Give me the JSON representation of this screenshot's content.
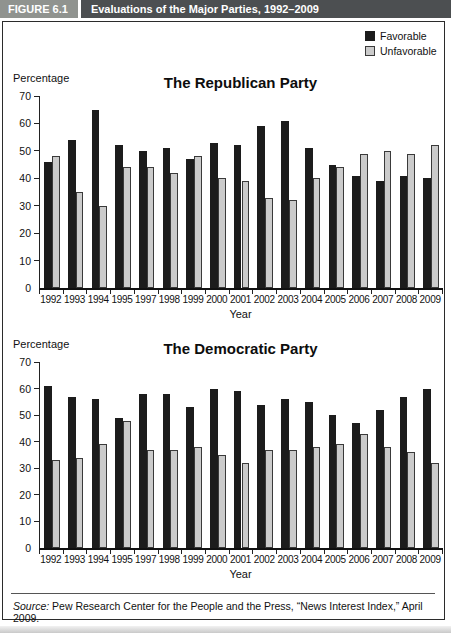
{
  "header": {
    "figure_label": "FIGURE 6.1",
    "title": "Evaluations of the Major Parties, 1992–2009"
  },
  "legend": {
    "position": "top-right",
    "items": [
      {
        "label": "Favorable",
        "color": "#1c1c1c",
        "swatch": "black-square-icon"
      },
      {
        "label": "Unfavorable",
        "color": "#cbcbcb",
        "swatch": "gray-square-icon"
      }
    ]
  },
  "source": {
    "prefix": "Source:",
    "text": " Pew Research Center for the People and the Press, “News Interest Index,” April 2009."
  },
  "colors": {
    "header_label_bg": "#90938f",
    "header_title_bg": "#4c4f51",
    "favorable_bar": "#1c1c1c",
    "unfavorable_bar": "#cbcbcb",
    "border": "#2b2b2b"
  },
  "chart_data": [
    {
      "type": "bar",
      "title": "The Republican Party",
      "ylabel": "Percentage",
      "xlabel": "Year",
      "ylim": [
        0,
        70
      ],
      "yticks": [
        0,
        10,
        20,
        30,
        40,
        50,
        60,
        70
      ],
      "grid": false,
      "legend_position": "top-right",
      "categories": [
        "1992",
        "1993",
        "1994",
        "1995",
        "1997",
        "1998",
        "1999",
        "2000",
        "2001",
        "2002",
        "2003",
        "2004",
        "2005",
        "2006",
        "2007",
        "2008",
        "2009"
      ],
      "series": [
        {
          "name": "Favorable",
          "color": "#1c1c1c",
          "values": [
            46,
            54,
            65,
            52,
            50,
            51,
            47,
            53,
            52,
            59,
            61,
            51,
            45,
            41,
            39,
            41,
            40
          ]
        },
        {
          "name": "Unfavorable",
          "color": "#cbcbcb",
          "values": [
            48,
            35,
            30,
            44,
            44,
            42,
            48,
            40,
            39,
            33,
            32,
            40,
            44,
            49,
            50,
            49,
            52
          ]
        }
      ]
    },
    {
      "type": "bar",
      "title": "The Democratic Party",
      "ylabel": "Percentage",
      "xlabel": "Year",
      "ylim": [
        0,
        70
      ],
      "yticks": [
        0,
        10,
        20,
        30,
        40,
        50,
        60,
        70
      ],
      "grid": false,
      "legend_position": "none",
      "categories": [
        "1992",
        "1993",
        "1994",
        "1995",
        "1997",
        "1998",
        "1999",
        "2000",
        "2001",
        "2002",
        "2003",
        "2004",
        "2005",
        "2006",
        "2007",
        "2008",
        "2009"
      ],
      "series": [
        {
          "name": "Favorable",
          "color": "#1c1c1c",
          "values": [
            61,
            57,
            56,
            49,
            58,
            58,
            53,
            60,
            59,
            54,
            56,
            55,
            50,
            47,
            52,
            57,
            60
          ]
        },
        {
          "name": "Unfavorable",
          "color": "#cbcbcb",
          "values": [
            33,
            34,
            39,
            48,
            37,
            37,
            38,
            35,
            32,
            37,
            37,
            38,
            39,
            43,
            38,
            36,
            32
          ]
        }
      ]
    }
  ]
}
